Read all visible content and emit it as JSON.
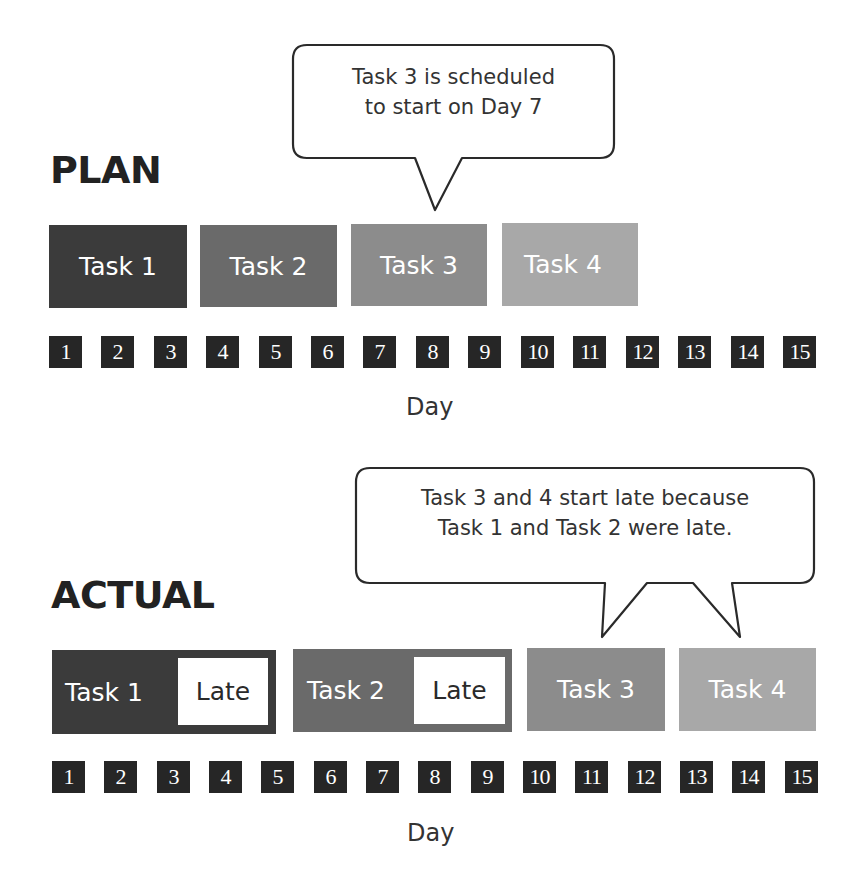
{
  "plan": {
    "heading": "PLAN",
    "callout": {
      "line1": "Task 3 is scheduled",
      "line2": "to start on Day 7"
    },
    "tasks": [
      {
        "label": "Task 1",
        "color": "#3b3b3b",
        "start_day": 1,
        "end_day": 3
      },
      {
        "label": "Task 2",
        "color": "#6a6a6a",
        "start_day": 4,
        "end_day": 6
      },
      {
        "label": "Task 3",
        "color": "#8c8c8c",
        "start_day": 7,
        "end_day": 9
      },
      {
        "label": "Task 4",
        "color": "#a8a8a8",
        "start_day": 10,
        "end_day": 12
      }
    ],
    "days": [
      "1",
      "2",
      "3",
      "4",
      "5",
      "6",
      "7",
      "8",
      "9",
      "10",
      "11",
      "12",
      "13",
      "14",
      "15"
    ],
    "axis_label": "Day"
  },
  "actual": {
    "heading": "ACTUAL",
    "callout": {
      "line1": "Task 3 and 4 start late because",
      "line2": "Task 1 and Task 2 were late."
    },
    "tasks": [
      {
        "label": "Task 1",
        "late_label": "Late",
        "color": "#3b3b3b",
        "start_day": 1,
        "end_day": 5
      },
      {
        "label": "Task 2",
        "late_label": "Late",
        "color": "#6a6a6a",
        "start_day": 6,
        "end_day": 9
      },
      {
        "label": "Task 3",
        "color": "#8c8c8c",
        "start_day": 10,
        "end_day": 12
      },
      {
        "label": "Task 4",
        "color": "#a8a8a8",
        "start_day": 13,
        "end_day": 15
      }
    ],
    "days": [
      "1",
      "2",
      "3",
      "4",
      "5",
      "6",
      "7",
      "8",
      "9",
      "10",
      "11",
      "12",
      "13",
      "14",
      "15"
    ],
    "axis_label": "Day"
  },
  "colors": {
    "day_box": "#262626",
    "heading": "#222222",
    "callout_border": "#2a2a2a"
  }
}
